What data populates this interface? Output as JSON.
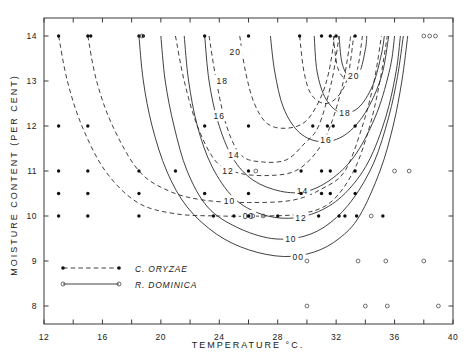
{
  "chart_data": {
    "type": "line",
    "title": "",
    "xlabel": "TEMPERATURE  °C.",
    "ylabel": "MOISTURE CONTENT (PER CENT)",
    "xlim": [
      12,
      40
    ],
    "ylim": [
      7.6,
      14.4
    ],
    "xticks": [
      12,
      14,
      16,
      18,
      20,
      22,
      24,
      26,
      28,
      30,
      32,
      34,
      36,
      38,
      40
    ],
    "xticklabels": [
      "12",
      "",
      "16",
      "",
      "20",
      "",
      "24",
      "",
      "28",
      "",
      "32",
      "",
      "36",
      "",
      "40"
    ],
    "yticks": [
      8,
      9,
      10,
      11,
      12,
      13,
      14
    ],
    "yticklabels": [
      "8",
      "9",
      "10",
      "11",
      "12",
      "13",
      "14"
    ],
    "grid": false,
    "legend_position": "lower-left",
    "series": [
      {
        "name": "C. ORYZAE",
        "style": "dashed",
        "marker": "filled-circle",
        "contour_labels": [
          "20",
          "18",
          "16",
          "14",
          "12",
          "10",
          "00"
        ]
      },
      {
        "name": "R. DOMINICA",
        "style": "solid",
        "marker": "open-circle",
        "contour_labels": [
          "20",
          "18",
          "16",
          "14",
          "12",
          "10",
          "00"
        ]
      }
    ],
    "contours_oryzae": [
      {
        "label": "00",
        "points": [
          [
            13.0,
            14.0
          ],
          [
            13.6,
            13.0
          ],
          [
            14.6,
            12.0
          ],
          [
            16.2,
            11.0
          ],
          [
            18.4,
            10.3
          ],
          [
            21.0,
            10.05
          ],
          [
            24.0,
            10.0
          ],
          [
            27.0,
            10.0
          ],
          [
            29.6,
            10.05
          ],
          [
            31.6,
            10.3
          ],
          [
            33.2,
            11.0
          ],
          [
            34.3,
            12.0
          ],
          [
            35.0,
            13.0
          ],
          [
            35.5,
            14.0
          ]
        ]
      },
      {
        "label": "10",
        "points": [
          [
            15.0,
            14.0
          ],
          [
            15.6,
            13.0
          ],
          [
            16.7,
            12.0
          ],
          [
            18.5,
            11.0
          ],
          [
            20.6,
            10.55
          ],
          [
            23.0,
            10.35
          ],
          [
            26.0,
            10.3
          ],
          [
            29.0,
            10.35
          ],
          [
            31.0,
            10.6
          ],
          [
            32.6,
            11.0
          ],
          [
            33.8,
            12.0
          ],
          [
            34.6,
            13.0
          ],
          [
            35.1,
            14.0
          ]
        ]
      },
      {
        "label": "12",
        "points": [
          [
            21.0,
            14.0
          ],
          [
            21.6,
            13.0
          ],
          [
            22.5,
            12.0
          ],
          [
            23.8,
            11.2
          ],
          [
            25.4,
            10.95
          ],
          [
            27.4,
            10.9
          ],
          [
            29.2,
            11.0
          ],
          [
            30.6,
            11.4
          ],
          [
            31.6,
            12.0
          ],
          [
            32.5,
            13.0
          ],
          [
            33.0,
            14.0
          ]
        ]
      },
      {
        "label": "14",
        "points": [
          [
            23.3,
            14.0
          ],
          [
            23.8,
            13.0
          ],
          [
            24.5,
            12.0
          ],
          [
            25.5,
            11.35
          ],
          [
            27.0,
            11.2
          ],
          [
            28.6,
            11.25
          ],
          [
            29.8,
            11.6
          ],
          [
            30.8,
            12.0
          ],
          [
            31.7,
            13.0
          ],
          [
            32.2,
            14.0
          ]
        ]
      },
      {
        "label": "16",
        "points": [
          [
            25.4,
            14.0
          ],
          [
            25.8,
            13.2
          ],
          [
            26.4,
            12.5
          ],
          [
            27.3,
            12.05
          ],
          [
            28.6,
            11.95
          ],
          [
            29.9,
            12.1
          ],
          [
            30.9,
            12.6
          ],
          [
            31.5,
            13.2
          ],
          [
            31.9,
            14.0
          ]
        ]
      },
      {
        "label": "18",
        "points": [
          [
            29.5,
            14.0
          ],
          [
            29.8,
            13.2
          ],
          [
            30.3,
            12.7
          ],
          [
            31.2,
            12.5
          ],
          [
            32.1,
            12.65
          ],
          [
            32.8,
            13.1
          ],
          [
            33.2,
            14.0
          ]
        ]
      },
      {
        "label": "20",
        "points": [
          [
            31.8,
            14.0
          ],
          [
            32.1,
            13.3
          ],
          [
            32.7,
            13.05
          ],
          [
            33.4,
            13.2
          ],
          [
            33.8,
            14.0
          ]
        ]
      }
    ],
    "contours_dominica": [
      {
        "label": "00",
        "points": [
          [
            18.5,
            14.0
          ],
          [
            18.8,
            13.0
          ],
          [
            19.4,
            12.0
          ],
          [
            20.4,
            11.0
          ],
          [
            21.8,
            10.2
          ],
          [
            23.8,
            9.6
          ],
          [
            26.0,
            9.25
          ],
          [
            28.4,
            9.1
          ],
          [
            30.5,
            9.2
          ],
          [
            32.2,
            9.5
          ],
          [
            33.6,
            10.0
          ],
          [
            35.0,
            11.0
          ],
          [
            35.9,
            12.0
          ],
          [
            36.5,
            13.0
          ],
          [
            36.9,
            14.0
          ]
        ]
      },
      {
        "label": "10",
        "points": [
          [
            20.0,
            14.0
          ],
          [
            20.3,
            13.0
          ],
          [
            20.9,
            12.0
          ],
          [
            21.8,
            11.0
          ],
          [
            23.2,
            10.2
          ],
          [
            25.2,
            9.75
          ],
          [
            27.6,
            9.5
          ],
          [
            29.8,
            9.55
          ],
          [
            31.6,
            9.85
          ],
          [
            33.2,
            10.4
          ],
          [
            34.6,
            11.2
          ],
          [
            35.6,
            12.2
          ],
          [
            36.2,
            13.1
          ],
          [
            36.6,
            14.0
          ]
        ]
      },
      {
        "label": "12",
        "points": [
          [
            21.6,
            14.0
          ],
          [
            21.9,
            13.0
          ],
          [
            22.5,
            12.0
          ],
          [
            23.5,
            11.1
          ],
          [
            25.0,
            10.4
          ],
          [
            26.8,
            10.05
          ],
          [
            28.8,
            9.95
          ],
          [
            30.8,
            10.1
          ],
          [
            32.6,
            10.5
          ],
          [
            34.2,
            11.2
          ],
          [
            35.4,
            12.2
          ],
          [
            36.1,
            13.2
          ],
          [
            36.4,
            14.0
          ]
        ]
      },
      {
        "label": "14",
        "points": [
          [
            23.0,
            14.0
          ],
          [
            23.3,
            13.0
          ],
          [
            23.9,
            12.1
          ],
          [
            24.9,
            11.3
          ],
          [
            26.3,
            10.8
          ],
          [
            28.2,
            10.55
          ],
          [
            30.0,
            10.55
          ],
          [
            31.8,
            10.85
          ],
          [
            33.4,
            11.4
          ],
          [
            34.8,
            12.3
          ],
          [
            35.7,
            13.3
          ],
          [
            36.0,
            14.0
          ]
        ]
      },
      {
        "label": "16",
        "points": [
          [
            27.5,
            14.0
          ],
          [
            27.8,
            13.2
          ],
          [
            28.4,
            12.4
          ],
          [
            29.5,
            11.85
          ],
          [
            31.0,
            11.65
          ],
          [
            32.6,
            11.8
          ],
          [
            34.0,
            12.3
          ],
          [
            35.1,
            13.1
          ],
          [
            35.6,
            14.0
          ]
        ]
      },
      {
        "label": "18",
        "points": [
          [
            30.5,
            14.0
          ],
          [
            30.7,
            13.2
          ],
          [
            31.3,
            12.6
          ],
          [
            32.3,
            12.3
          ],
          [
            33.5,
            12.4
          ],
          [
            34.5,
            12.9
          ],
          [
            35.1,
            13.6
          ],
          [
            35.3,
            14.0
          ]
        ]
      },
      {
        "label": "20",
        "points": [
          [
            32.2,
            14.0
          ],
          [
            32.4,
            13.4
          ],
          [
            32.9,
            13.1
          ],
          [
            33.6,
            13.2
          ],
          [
            34.0,
            13.7
          ],
          [
            34.1,
            14.0
          ]
        ]
      }
    ],
    "points_oryzae": [
      [
        13.0,
        14.0
      ],
      [
        15.0,
        14.0
      ],
      [
        15.2,
        14.0
      ],
      [
        18.5,
        14.0
      ],
      [
        18.8,
        14.0
      ],
      [
        23.0,
        14.0
      ],
      [
        26.0,
        14.0
      ],
      [
        29.5,
        14.0
      ],
      [
        31.0,
        14.0
      ],
      [
        31.6,
        14.0
      ],
      [
        32.0,
        14.0
      ],
      [
        33.3,
        14.0
      ],
      [
        13.0,
        12.0
      ],
      [
        15.0,
        12.0
      ],
      [
        23.0,
        12.0
      ],
      [
        26.0,
        12.0
      ],
      [
        30.4,
        12.0
      ],
      [
        31.4,
        12.0
      ],
      [
        31.8,
        12.0
      ],
      [
        33.3,
        12.0
      ],
      [
        13.0,
        11.0
      ],
      [
        15.0,
        11.0
      ],
      [
        18.5,
        11.0
      ],
      [
        21.0,
        11.0
      ],
      [
        26.0,
        11.0
      ],
      [
        29.6,
        11.0
      ],
      [
        31.0,
        11.0
      ],
      [
        31.6,
        11.0
      ],
      [
        33.3,
        11.0
      ],
      [
        13.0,
        10.5
      ],
      [
        15.0,
        10.5
      ],
      [
        18.5,
        10.5
      ],
      [
        23.0,
        10.5
      ],
      [
        26.0,
        10.5
      ],
      [
        29.6,
        10.5
      ],
      [
        31.0,
        10.5
      ],
      [
        31.6,
        10.5
      ],
      [
        33.3,
        10.5
      ],
      [
        13.0,
        10.0
      ],
      [
        15.0,
        10.0
      ],
      [
        18.5,
        10.0
      ],
      [
        23.6,
        10.0
      ],
      [
        25.0,
        10.0
      ],
      [
        26.0,
        10.0
      ],
      [
        28.0,
        10.0
      ],
      [
        30.8,
        10.0
      ],
      [
        32.2,
        10.0
      ],
      [
        32.6,
        10.0
      ],
      [
        33.4,
        10.0
      ],
      [
        35.2,
        10.0
      ]
    ],
    "points_dominica": [
      [
        18.7,
        14.0
      ],
      [
        38.0,
        14.0
      ],
      [
        38.4,
        14.0
      ],
      [
        38.8,
        14.0
      ],
      [
        26.5,
        11.0
      ],
      [
        36.0,
        11.0
      ],
      [
        37.0,
        11.0
      ],
      [
        26.3,
        10.0
      ],
      [
        27.0,
        10.0
      ],
      [
        34.4,
        10.0
      ],
      [
        30.0,
        9.0
      ],
      [
        33.5,
        9.0
      ],
      [
        35.4,
        9.0
      ],
      [
        38.0,
        9.0
      ],
      [
        30.0,
        8.0
      ],
      [
        34.0,
        8.0
      ],
      [
        35.5,
        8.0
      ],
      [
        39.0,
        8.0
      ]
    ]
  },
  "legend": {
    "items": [
      {
        "label": "C. ORYZAE",
        "style": "dashed",
        "marker": "filled-circle"
      },
      {
        "label": "R. DOMINICA",
        "style": "solid",
        "marker": "open-circle"
      }
    ]
  }
}
